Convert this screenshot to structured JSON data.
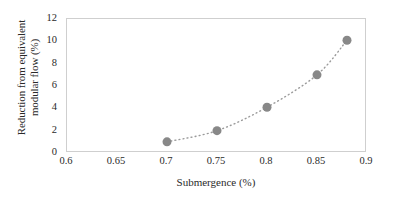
{
  "chart_data": {
    "type": "scatter",
    "title": "",
    "xlabel": "Submergence (%)",
    "ylabel": "Reduction from equivalent modular flow (%)",
    "ylabel_line1": "Reduction from equivalent",
    "ylabel_line2": "modular flow (%)",
    "x": [
      0.7,
      0.75,
      0.8,
      0.85,
      0.88
    ],
    "values": [
      1.0,
      2.0,
      4.1,
      7.0,
      10.1
    ],
    "series": [
      {
        "name": "Reduction from equivalent modular flow",
        "x": [
          0.7,
          0.75,
          0.8,
          0.85,
          0.88
        ],
        "values": [
          1.0,
          2.0,
          4.1,
          7.0,
          10.1
        ]
      }
    ],
    "xlim": [
      0.6,
      0.9
    ],
    "ylim": [
      0,
      12
    ],
    "xticks": [
      0.6,
      0.65,
      0.7,
      0.75,
      0.8,
      0.85,
      0.9
    ],
    "xtick_labels": [
      "0.6",
      "0.65",
      "0.7",
      "0.75",
      "0.8",
      "0.85",
      "0.9"
    ],
    "yticks": [
      0,
      2,
      4,
      6,
      8,
      10,
      12
    ],
    "ytick_labels": [
      "0",
      "2",
      "4",
      "6",
      "8",
      "10",
      "12"
    ],
    "grid": false,
    "legend": false,
    "legend_position": "none",
    "marker": {
      "shape": "circle",
      "color": "#888888",
      "size_px": 9
    },
    "trendline": {
      "style": "dotted",
      "color": "#9a9a9a",
      "width_px": 1.4,
      "description": "dotted curve through all data points"
    },
    "plot_background": "#ffffff",
    "frame_color": "#cfcfcf",
    "text_color": "#2a2a2a"
  }
}
